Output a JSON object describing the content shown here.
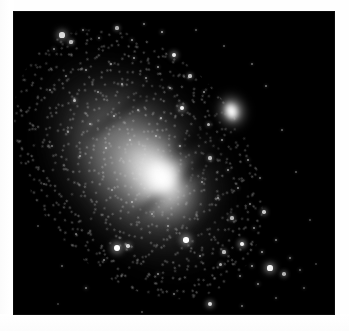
{
  "page": {
    "background_color": "#ffffff",
    "width": 349,
    "height": 331
  },
  "photo": {
    "label": "astronomical-photograph",
    "alt_text": "Grayscale telescope photograph of a large inclined spiral galaxy with a bright elongated nucleus, dark dust lanes, a dense resolved star field, and a small bright companion galaxy above and to the right.",
    "background_color": "#000000",
    "left": 14,
    "top": 12,
    "width": 320,
    "height": 302,
    "palette": {
      "sky": "#000000",
      "halo": "#6e6e6e",
      "disk": "#a8a8a8",
      "bulge": "#e8e8e8",
      "nucleus": "#ffffff",
      "dust_lane": "#0a0a0a"
    }
  },
  "galaxy": {
    "name_label": "spiral-galaxy",
    "major_axis_angle_deg": -38,
    "nucleus": {
      "cx": 148,
      "cy": 166,
      "rx": 22,
      "ry": 30
    },
    "bulge": {
      "cx": 141,
      "cy": 163,
      "rx": 43,
      "ry": 65
    },
    "disk": {
      "cx": 121,
      "cy": 152,
      "rx": 79,
      "ry": 124
    },
    "halo": {
      "cx": 124,
      "cy": 152,
      "rx": 106,
      "ry": 150
    },
    "dust_lanes": [
      {
        "cx": 179,
        "cy": 127,
        "len": 118,
        "thick": 15,
        "opacity": 0.55
      },
      {
        "cx": 179,
        "cy": 158,
        "len": 150,
        "thick": 13,
        "opacity": 0.45
      },
      {
        "cx": 118,
        "cy": 91,
        "len": 120,
        "thick": 11,
        "opacity": 0.4
      },
      {
        "cx": 205,
        "cy": 202,
        "len": 110,
        "thick": 12,
        "opacity": 0.38
      }
    ]
  },
  "companion_galaxy": {
    "name_label": "companion-elliptical-galaxy",
    "cx": 218,
    "cy": 99,
    "rx": 20,
    "ry": 23,
    "core_brightness": 1.0
  },
  "stars": [
    {
      "x": 48,
      "y": 23,
      "r": 2.6,
      "b": 1.0
    },
    {
      "x": 57,
      "y": 30,
      "r": 1.6,
      "b": 0.8
    },
    {
      "x": 40,
      "y": 37,
      "r": 1.3,
      "b": 0.62
    },
    {
      "x": 69,
      "y": 18,
      "r": 1.1,
      "b": 0.55
    },
    {
      "x": 85,
      "y": 26,
      "r": 1.2,
      "b": 0.6
    },
    {
      "x": 103,
      "y": 16,
      "r": 1.6,
      "b": 0.72
    },
    {
      "x": 118,
      "y": 28,
      "r": 1.3,
      "b": 0.58
    },
    {
      "x": 130,
      "y": 12,
      "r": 1.1,
      "b": 0.52
    },
    {
      "x": 148,
      "y": 20,
      "r": 1.4,
      "b": 0.66
    },
    {
      "x": 160,
      "y": 43,
      "r": 2.1,
      "b": 0.92
    },
    {
      "x": 144,
      "y": 55,
      "r": 1.2,
      "b": 0.58
    },
    {
      "x": 120,
      "y": 46,
      "r": 1.3,
      "b": 0.6
    },
    {
      "x": 97,
      "y": 52,
      "r": 1.1,
      "b": 0.5
    },
    {
      "x": 72,
      "y": 58,
      "r": 1.2,
      "b": 0.55
    },
    {
      "x": 52,
      "y": 64,
      "r": 1.0,
      "b": 0.46
    },
    {
      "x": 36,
      "y": 78,
      "r": 1.1,
      "b": 0.48
    },
    {
      "x": 60,
      "y": 88,
      "r": 1.5,
      "b": 0.68
    },
    {
      "x": 84,
      "y": 80,
      "r": 1.2,
      "b": 0.54
    },
    {
      "x": 108,
      "y": 72,
      "r": 1.3,
      "b": 0.6
    },
    {
      "x": 132,
      "y": 66,
      "r": 1.1,
      "b": 0.52
    },
    {
      "x": 156,
      "y": 76,
      "r": 1.3,
      "b": 0.62
    },
    {
      "x": 176,
      "y": 64,
      "r": 1.6,
      "b": 0.74
    },
    {
      "x": 190,
      "y": 80,
      "r": 1.2,
      "b": 0.56
    },
    {
      "x": 168,
      "y": 96,
      "r": 2.2,
      "b": 0.95
    },
    {
      "x": 147,
      "y": 106,
      "r": 1.3,
      "b": 0.58
    },
    {
      "x": 124,
      "y": 98,
      "r": 1.1,
      "b": 0.5
    },
    {
      "x": 100,
      "y": 104,
      "r": 1.4,
      "b": 0.64
    },
    {
      "x": 76,
      "y": 112,
      "r": 1.2,
      "b": 0.55
    },
    {
      "x": 54,
      "y": 120,
      "r": 1.1,
      "b": 0.5
    },
    {
      "x": 38,
      "y": 134,
      "r": 1.0,
      "b": 0.44
    },
    {
      "x": 66,
      "y": 144,
      "r": 1.2,
      "b": 0.54
    },
    {
      "x": 92,
      "y": 136,
      "r": 1.3,
      "b": 0.58
    },
    {
      "x": 116,
      "y": 128,
      "r": 1.1,
      "b": 0.5
    },
    {
      "x": 142,
      "y": 124,
      "r": 1.2,
      "b": 0.54
    },
    {
      "x": 166,
      "y": 134,
      "r": 1.3,
      "b": 0.58
    },
    {
      "x": 194,
      "y": 112,
      "r": 1.5,
      "b": 0.68
    },
    {
      "x": 208,
      "y": 128,
      "r": 1.2,
      "b": 0.54
    },
    {
      "x": 196,
      "y": 146,
      "r": 1.6,
      "b": 0.72
    },
    {
      "x": 214,
      "y": 158,
      "r": 1.3,
      "b": 0.58
    },
    {
      "x": 188,
      "y": 170,
      "r": 1.2,
      "b": 0.52
    },
    {
      "x": 204,
      "y": 186,
      "r": 1.4,
      "b": 0.62
    },
    {
      "x": 224,
      "y": 176,
      "r": 1.2,
      "b": 0.54
    },
    {
      "x": 236,
      "y": 192,
      "r": 1.1,
      "b": 0.48
    },
    {
      "x": 218,
      "y": 206,
      "r": 1.6,
      "b": 0.7
    },
    {
      "x": 240,
      "y": 216,
      "r": 1.3,
      "b": 0.56
    },
    {
      "x": 228,
      "y": 232,
      "r": 2.4,
      "b": 0.96
    },
    {
      "x": 248,
      "y": 240,
      "r": 1.4,
      "b": 0.62
    },
    {
      "x": 262,
      "y": 228,
      "r": 1.2,
      "b": 0.52
    },
    {
      "x": 256,
      "y": 256,
      "r": 2.6,
      "b": 1.0
    },
    {
      "x": 270,
      "y": 262,
      "r": 1.8,
      "b": 0.8
    },
    {
      "x": 276,
      "y": 246,
      "r": 1.3,
      "b": 0.56
    },
    {
      "x": 286,
      "y": 258,
      "r": 1.2,
      "b": 0.5
    },
    {
      "x": 244,
      "y": 272,
      "r": 1.4,
      "b": 0.6
    },
    {
      "x": 226,
      "y": 264,
      "r": 1.2,
      "b": 0.52
    },
    {
      "x": 206,
      "y": 252,
      "r": 1.5,
      "b": 0.66
    },
    {
      "x": 186,
      "y": 244,
      "r": 1.3,
      "b": 0.56
    },
    {
      "x": 172,
      "y": 228,
      "r": 2.8,
      "b": 1.0
    },
    {
      "x": 154,
      "y": 214,
      "r": 1.2,
      "b": 0.52
    },
    {
      "x": 138,
      "y": 202,
      "r": 1.1,
      "b": 0.48
    },
    {
      "x": 118,
      "y": 190,
      "r": 1.2,
      "b": 0.52
    },
    {
      "x": 98,
      "y": 178,
      "r": 1.1,
      "b": 0.46
    },
    {
      "x": 103,
      "y": 236,
      "r": 2.9,
      "b": 1.0
    },
    {
      "x": 114,
      "y": 234,
      "r": 1.8,
      "b": 0.82
    },
    {
      "x": 90,
      "y": 248,
      "r": 1.2,
      "b": 0.5
    },
    {
      "x": 62,
      "y": 222,
      "r": 1.1,
      "b": 0.44
    },
    {
      "x": 48,
      "y": 254,
      "r": 1.0,
      "b": 0.4
    },
    {
      "x": 72,
      "y": 276,
      "r": 1.3,
      "b": 0.54
    },
    {
      "x": 144,
      "y": 262,
      "r": 1.3,
      "b": 0.56
    },
    {
      "x": 160,
      "y": 282,
      "r": 1.1,
      "b": 0.46
    },
    {
      "x": 196,
      "y": 292,
      "r": 2.3,
      "b": 0.94
    },
    {
      "x": 228,
      "y": 294,
      "r": 1.2,
      "b": 0.5
    },
    {
      "x": 262,
      "y": 286,
      "r": 1.1,
      "b": 0.44
    },
    {
      "x": 290,
      "y": 276,
      "r": 1.2,
      "b": 0.48
    },
    {
      "x": 182,
      "y": 18,
      "r": 1.0,
      "b": 0.38
    },
    {
      "x": 210,
      "y": 34,
      "r": 1.0,
      "b": 0.36
    },
    {
      "x": 238,
      "y": 52,
      "r": 1.1,
      "b": 0.42
    },
    {
      "x": 252,
      "y": 74,
      "r": 1.2,
      "b": 0.46
    },
    {
      "x": 268,
      "y": 118,
      "r": 1.1,
      "b": 0.4
    },
    {
      "x": 282,
      "y": 160,
      "r": 1.0,
      "b": 0.36
    },
    {
      "x": 296,
      "y": 208,
      "r": 1.0,
      "b": 0.34
    },
    {
      "x": 30,
      "y": 172,
      "r": 1.0,
      "b": 0.34
    },
    {
      "x": 24,
      "y": 214,
      "r": 0.9,
      "b": 0.3
    },
    {
      "x": 44,
      "y": 292,
      "r": 0.9,
      "b": 0.3
    },
    {
      "x": 128,
      "y": 300,
      "r": 0.9,
      "b": 0.32
    },
    {
      "x": 302,
      "y": 252,
      "r": 0.9,
      "b": 0.3
    },
    {
      "x": 250,
      "y": 200,
      "r": 1.7,
      "b": 0.78
    },
    {
      "x": 234,
      "y": 148,
      "r": 1.3,
      "b": 0.54
    },
    {
      "x": 246,
      "y": 166,
      "r": 1.1,
      "b": 0.44
    },
    {
      "x": 210,
      "y": 240,
      "r": 1.6,
      "b": 0.72
    },
    {
      "x": 238,
      "y": 254,
      "r": 1.4,
      "b": 0.62
    }
  ]
}
